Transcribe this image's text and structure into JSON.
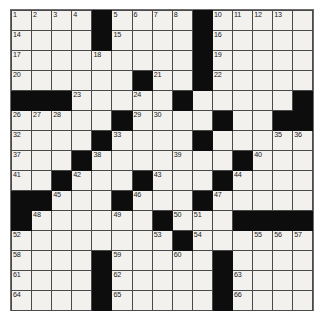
{
  "puzzle": {
    "title": "Crossword Grid",
    "rows": 15,
    "cols": 15,
    "cell_size_px": 20,
    "colors": {
      "block": "#0d0d0d",
      "open": "#f2f1ee",
      "grid_line": "#4a4a4a",
      "number_text": "#1a1a1a",
      "page_background": "#ffffff"
    },
    "blocks": [
      [
        0,
        4
      ],
      [
        0,
        9
      ],
      [
        1,
        4
      ],
      [
        1,
        9
      ],
      [
        2,
        9
      ],
      [
        3,
        6
      ],
      [
        3,
        9
      ],
      [
        4,
        0
      ],
      [
        4,
        1
      ],
      [
        4,
        2
      ],
      [
        4,
        8
      ],
      [
        4,
        14
      ],
      [
        5,
        5
      ],
      [
        5,
        10
      ],
      [
        5,
        13
      ],
      [
        5,
        14
      ],
      [
        6,
        4
      ],
      [
        6,
        9
      ],
      [
        7,
        3
      ],
      [
        7,
        11
      ],
      [
        8,
        2
      ],
      [
        8,
        6
      ],
      [
        8,
        10
      ],
      [
        9,
        0
      ],
      [
        9,
        1
      ],
      [
        9,
        5
      ],
      [
        9,
        9
      ],
      [
        10,
        0
      ],
      [
        10,
        7
      ],
      [
        10,
        11
      ],
      [
        10,
        12
      ],
      [
        10,
        13
      ],
      [
        10,
        14
      ],
      [
        11,
        8
      ],
      [
        12,
        4
      ],
      [
        12,
        10
      ],
      [
        13,
        4
      ],
      [
        13,
        10
      ],
      [
        14,
        4
      ],
      [
        14,
        10
      ]
    ],
    "numbers": [
      {
        "r": 0,
        "c": 0,
        "n": "1"
      },
      {
        "r": 0,
        "c": 1,
        "n": "2"
      },
      {
        "r": 0,
        "c": 2,
        "n": "3"
      },
      {
        "r": 0,
        "c": 3,
        "n": "4"
      },
      {
        "r": 0,
        "c": 5,
        "n": "5"
      },
      {
        "r": 0,
        "c": 6,
        "n": "6"
      },
      {
        "r": 0,
        "c": 7,
        "n": "7"
      },
      {
        "r": 0,
        "c": 8,
        "n": "8"
      },
      {
        "r": 0,
        "c": 9,
        "n": "9"
      },
      {
        "r": 0,
        "c": 10,
        "n": "10"
      },
      {
        "r": 0,
        "c": 11,
        "n": "11"
      },
      {
        "r": 0,
        "c": 12,
        "n": "12"
      },
      {
        "r": 0,
        "c": 13,
        "n": "13"
      },
      {
        "r": 1,
        "c": 0,
        "n": "14"
      },
      {
        "r": 1,
        "c": 5,
        "n": "15"
      },
      {
        "r": 1,
        "c": 10,
        "n": "16"
      },
      {
        "r": 2,
        "c": 0,
        "n": "17"
      },
      {
        "r": 2,
        "c": 4,
        "n": "18"
      },
      {
        "r": 2,
        "c": 10,
        "n": "19"
      },
      {
        "r": 3,
        "c": 0,
        "n": "20"
      },
      {
        "r": 3,
        "c": 7,
        "n": "21"
      },
      {
        "r": 3,
        "c": 10,
        "n": "22"
      },
      {
        "r": 4,
        "c": 3,
        "n": "23"
      },
      {
        "r": 4,
        "c": 6,
        "n": "24"
      },
      {
        "r": 4,
        "c": 8,
        "n": "25"
      },
      {
        "r": 5,
        "c": 0,
        "n": "26"
      },
      {
        "r": 5,
        "c": 1,
        "n": "27"
      },
      {
        "r": 5,
        "c": 2,
        "n": "28"
      },
      {
        "r": 5,
        "c": 6,
        "n": "29"
      },
      {
        "r": 5,
        "c": 7,
        "n": "30"
      },
      {
        "r": 5,
        "c": 10,
        "n": "31"
      },
      {
        "r": 6,
        "c": 0,
        "n": "32"
      },
      {
        "r": 6,
        "c": 5,
        "n": "33"
      },
      {
        "r": 6,
        "c": 9,
        "n": "34"
      },
      {
        "r": 6,
        "c": 13,
        "n": "35"
      },
      {
        "r": 6,
        "c": 14,
        "n": "36"
      },
      {
        "r": 7,
        "c": 0,
        "n": "37"
      },
      {
        "r": 7,
        "c": 4,
        "n": "38"
      },
      {
        "r": 7,
        "c": 8,
        "n": "39"
      },
      {
        "r": 7,
        "c": 12,
        "n": "40"
      },
      {
        "r": 8,
        "c": 0,
        "n": "41"
      },
      {
        "r": 8,
        "c": 3,
        "n": "42"
      },
      {
        "r": 8,
        "c": 7,
        "n": "43"
      },
      {
        "r": 8,
        "c": 11,
        "n": "44"
      },
      {
        "r": 9,
        "c": 2,
        "n": "45"
      },
      {
        "r": 9,
        "c": 6,
        "n": "46"
      },
      {
        "r": 9,
        "c": 10,
        "n": "47"
      },
      {
        "r": 10,
        "c": 1,
        "n": "48"
      },
      {
        "r": 10,
        "c": 5,
        "n": "49"
      },
      {
        "r": 10,
        "c": 8,
        "n": "50"
      },
      {
        "r": 10,
        "c": 9,
        "n": "51"
      },
      {
        "r": 11,
        "c": 0,
        "n": "52"
      },
      {
        "r": 11,
        "c": 7,
        "n": "53"
      },
      {
        "r": 11,
        "c": 9,
        "n": "54"
      },
      {
        "r": 11,
        "c": 12,
        "n": "55"
      },
      {
        "r": 11,
        "c": 13,
        "n": "56"
      },
      {
        "r": 11,
        "c": 14,
        "n": "57"
      },
      {
        "r": 12,
        "c": 0,
        "n": "58"
      },
      {
        "r": 12,
        "c": 5,
        "n": "59"
      },
      {
        "r": 12,
        "c": 8,
        "n": "60"
      },
      {
        "r": 13,
        "c": 0,
        "n": "61"
      },
      {
        "r": 13,
        "c": 5,
        "n": "62"
      },
      {
        "r": 13,
        "c": 11,
        "n": "63"
      },
      {
        "r": 14,
        "c": 0,
        "n": "64"
      },
      {
        "r": 14,
        "c": 5,
        "n": "65"
      },
      {
        "r": 14,
        "c": 11,
        "n": "66"
      }
    ],
    "letters": []
  }
}
